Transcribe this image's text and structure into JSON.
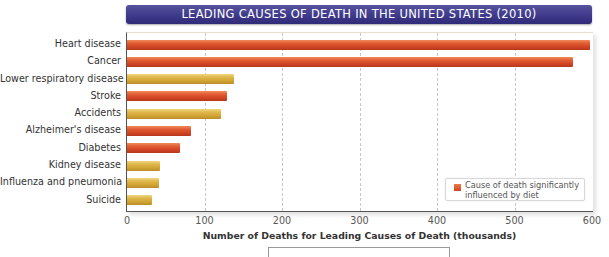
{
  "chart_data": {
    "type": "bar",
    "orientation": "horizontal",
    "title": "LEADING CAUSES OF DEATH IN THE UNITED STATES (2010)",
    "xlabel": "Number of Deaths for Leading Causes of Death (thousands)",
    "ylabel": "",
    "xlim": [
      0,
      600
    ],
    "xticks": [
      "0",
      "100",
      "200",
      "300",
      "400",
      "500",
      "600"
    ],
    "grid": "vertical dashed",
    "legend": {
      "position": "lower right",
      "entries": [
        {
          "label": "Cause of death significantly influenced by diet",
          "color": "#d6452a"
        }
      ]
    },
    "categories": [
      "Heart disease",
      "Cancer",
      "Lower respiratory disease",
      "Stroke",
      "Accidents",
      "Alzheimer's disease",
      "Diabetes",
      "Kidney disease",
      "Influenza and pneumonia",
      "Suicide"
    ],
    "values": [
      597,
      575,
      138,
      129,
      121,
      83,
      69,
      42,
      41,
      32
    ],
    "diet_influenced": [
      true,
      true,
      false,
      true,
      false,
      true,
      true,
      false,
      false,
      false
    ],
    "colors": {
      "diet": "#d6452a",
      "other": "#d8ac3c"
    }
  }
}
